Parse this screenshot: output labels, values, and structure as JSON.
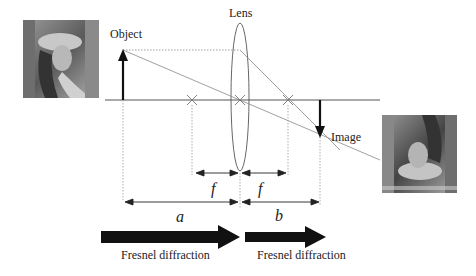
{
  "labels": {
    "lens": "Lens",
    "object": "Object",
    "image": "Image",
    "focal_left": "f",
    "focal_right": "f",
    "object_distance": "a",
    "image_distance": "b",
    "propagation_left": "Fresnel diffraction",
    "propagation_right": "Fresnel diffraction"
  },
  "images": {
    "object_picture": "portrait photo (upright)",
    "image_picture": "portrait photo (inverted, blurred)"
  }
}
